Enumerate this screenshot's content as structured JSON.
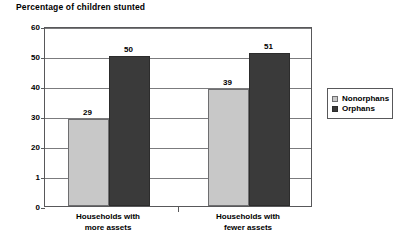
{
  "chart_data": {
    "type": "bar",
    "title": "Percentage of children stunted",
    "xlabel": "",
    "ylabel": "",
    "ylim": [
      0,
      60
    ],
    "yticks": [
      0,
      10,
      20,
      30,
      40,
      50,
      60
    ],
    "ytick_labels": [
      "0",
      "1",
      "20",
      "30",
      "40",
      "50",
      "60"
    ],
    "grid": true,
    "legend_position": "right",
    "categories": [
      "Households with\nmore assets",
      "Households with\nfewer assets"
    ],
    "series": [
      {
        "name": "Nonorphans",
        "color": "#c8c8c8",
        "values": [
          29,
          39
        ]
      },
      {
        "name": "Orphans",
        "color": "#3a3a3a",
        "values": [
          50,
          51
        ]
      }
    ]
  },
  "legend": {
    "items": [
      {
        "label": "Nonorphans"
      },
      {
        "label": "Orphans"
      }
    ]
  }
}
